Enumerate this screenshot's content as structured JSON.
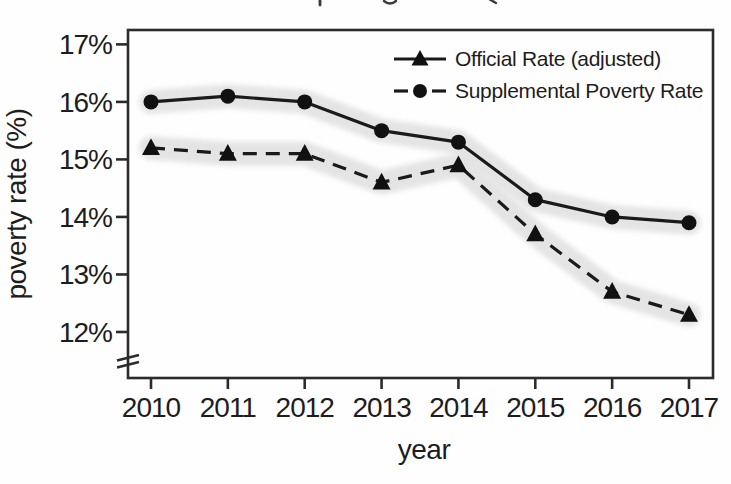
{
  "chart_data": {
    "type": "line",
    "title": "",
    "xlabel": "year",
    "ylabel": "poverty rate (%)",
    "x": [
      2010,
      2011,
      2012,
      2013,
      2014,
      2015,
      2016,
      2017
    ],
    "x_tick_labels": [
      "2010",
      "2011",
      "2012",
      "2013",
      "2014",
      "2015",
      "2016",
      "2017"
    ],
    "y_ticks": [
      17,
      16,
      15,
      14,
      13,
      12
    ],
    "y_tick_labels": [
      "17%",
      "16%",
      "15%",
      "14%",
      "13%",
      "12%"
    ],
    "ylim": [
      11.2,
      17.25
    ],
    "y_axis_break": true,
    "grid": false,
    "legend_position": "top-right inside plot",
    "series": [
      {
        "name": "Supplemental Poverty Rate",
        "marker": "circle",
        "plot_line_style": "solid",
        "values": [
          16.0,
          16.1,
          16.0,
          15.5,
          15.3,
          14.3,
          14.0,
          13.9
        ],
        "band_halfwidth_pct": 0.2
      },
      {
        "name": "Official Rate (adjusted)",
        "marker": "triangle",
        "plot_line_style": "dashed",
        "values": [
          15.2,
          15.1,
          15.1,
          14.6,
          14.9,
          13.7,
          12.7,
          12.3
        ],
        "band_halfwidth_pct": 0.2
      }
    ],
    "legend": [
      {
        "label": "Official Rate (adjusted)",
        "marker": "triangle",
        "line_style": "solid"
      },
      {
        "label": "Supplemental Poverty Rate",
        "marker": "circle",
        "line_style": "dashed"
      }
    ],
    "colors": {
      "line": "#1a1a1a",
      "marker": "#111111",
      "band": "#e3e3e3",
      "axis": "#2b2b2b",
      "text": "#1d1d1d",
      "background": "#ffffff"
    }
  }
}
